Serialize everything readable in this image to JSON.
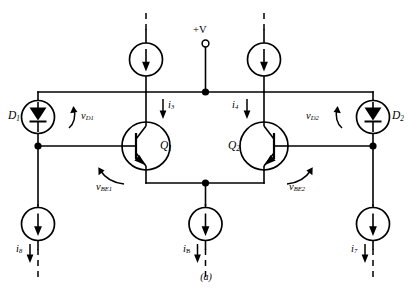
{
  "figure": {
    "caption": "(a)",
    "supply_label": "+V"
  },
  "devices": [
    {
      "id": "D1",
      "kind": "current-source-diode",
      "label": "D",
      "sub": "1"
    },
    {
      "id": "D2",
      "kind": "current-source-diode",
      "label": "D",
      "sub": "2"
    },
    {
      "id": "Q1",
      "kind": "npn-transistor",
      "label": "Q",
      "sub": "1"
    },
    {
      "id": "Q2",
      "kind": "npn-transistor",
      "label": "Q",
      "sub": "2"
    }
  ],
  "voltages": [
    {
      "id": "vD1",
      "label": "v",
      "sub": "D1",
      "sub_main": "D",
      "sub_idx": "1"
    },
    {
      "id": "vD2",
      "label": "v",
      "sub": "D2",
      "sub_main": "D",
      "sub_idx": "2"
    },
    {
      "id": "vBE1",
      "label": "v",
      "sub_main": "BE",
      "sub_idx": "1"
    },
    {
      "id": "vBE2",
      "label": "v",
      "sub_main": "BE",
      "sub_idx": "2"
    }
  ],
  "currents": [
    {
      "id": "i3",
      "label": "i",
      "sub": "3",
      "position": "collector-q1"
    },
    {
      "id": "i4",
      "label": "i",
      "sub": "4",
      "position": "collector-q2"
    },
    {
      "id": "i8",
      "label": "i",
      "sub": "8",
      "position": "bottom-left"
    },
    {
      "id": "iB",
      "label": "i",
      "sub": "B",
      "position": "bottom-center"
    },
    {
      "id": "i7",
      "label": "i",
      "sub": "7",
      "position": "bottom-right"
    }
  ],
  "colors": {
    "wire": "#000000",
    "dashed": "#000000",
    "background": "#ffffff"
  }
}
